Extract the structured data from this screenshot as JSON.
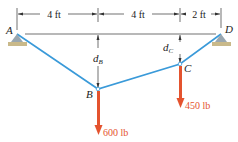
{
  "diagram": {
    "type": "cable-loading-statics",
    "points": {
      "A": "A",
      "B": "B",
      "C": "C",
      "D": "D"
    },
    "dimensions": {
      "AB": "4 ft",
      "BC": "4 ft",
      "CD": "2 ft",
      "dB": "d",
      "dB_sub": "B",
      "dC": "d",
      "dC_sub": "C"
    },
    "loads": {
      "B": "600 lb",
      "C": "450 lb"
    },
    "colors": {
      "cable": "#3a9ad9",
      "load": "#e4532e",
      "support": "#9aa7b0",
      "ground": "#c9b98a",
      "dim": "#222222"
    }
  }
}
